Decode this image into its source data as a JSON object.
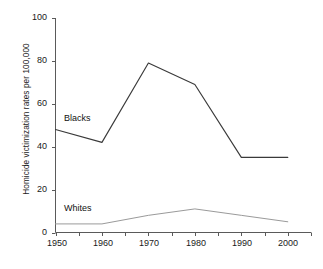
{
  "chart_data": {
    "type": "line",
    "title": "",
    "xlabel": "",
    "ylabel": "Homicide victimization rates per 100,000",
    "x": [
      1950,
      1960,
      1970,
      1980,
      1990,
      2000
    ],
    "xticklabels": [
      "1950",
      "1960",
      "1970",
      "1980",
      "1990",
      "2000"
    ],
    "yticklabels": [
      "0",
      "20",
      "40",
      "60",
      "80",
      "100"
    ],
    "yticks": [
      0,
      20,
      40,
      60,
      80,
      100
    ],
    "xlim": [
      1950,
      2005
    ],
    "ylim": [
      0,
      100
    ],
    "grid": false,
    "legend_position": "inline-labels",
    "series": [
      {
        "name": "Blacks",
        "values": [
          48,
          42,
          79,
          69,
          35,
          35
        ],
        "color": "#3a3a3a"
      },
      {
        "name": "Whites",
        "values": [
          4,
          4,
          8,
          11,
          8,
          5
        ],
        "color": "#9a9a9a"
      }
    ],
    "annotations": [
      {
        "text": "Blacks",
        "x": 1951.5,
        "y": 55
      },
      {
        "text": "Whites",
        "x": 1951.5,
        "y": 13
      }
    ]
  },
  "axes": {
    "y_title": "Homicide victimization rates per 100,000",
    "y_labels": {
      "t0": "0",
      "t1": "20",
      "t2": "40",
      "t3": "60",
      "t4": "80",
      "t5": "100"
    },
    "x_labels": {
      "t0": "1950",
      "t1": "1960",
      "t2": "1970",
      "t3": "1980",
      "t4": "1990",
      "t5": "2000"
    }
  },
  "series_labels": {
    "blacks": "Blacks",
    "whites": "Whites"
  },
  "colors": {
    "blacks_line": "#3a3a3a",
    "whites_line": "#9a9a9a",
    "axis": "#5a5a5a",
    "text": "#1a1a1a",
    "background": "#ffffff"
  }
}
